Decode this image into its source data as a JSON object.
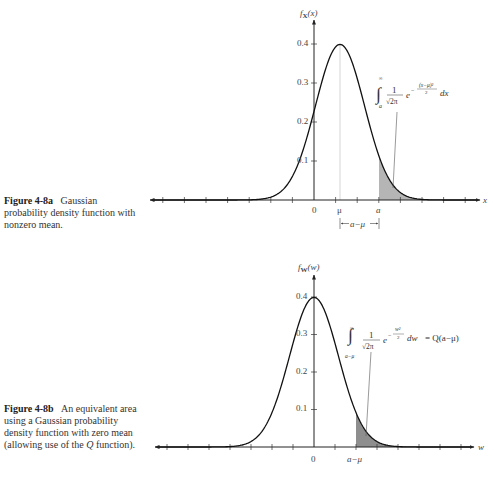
{
  "figures": [
    {
      "id": "4-8a",
      "caption_label": "Figure 4-8a",
      "caption_text": "Gaussian probability density function with nonzero mean.",
      "ylabel": "f_X(x)",
      "ylabel_main": "f",
      "ylabel_sub": "X",
      "ylabel_arg": "(x)",
      "xlabel": "x",
      "ytick_labels": [
        "0.1",
        "0.2",
        "0.3",
        "0.4"
      ],
      "xtick_labels": [
        "0",
        "μ",
        "a"
      ],
      "bracket_label": "a−μ",
      "integral": {
        "lower": "a",
        "upper": "∞",
        "coef_num": "1",
        "coef_den": "√2π",
        "exp": "−(x−μ)²/2",
        "exp_num": "(x−μ)²",
        "exp_den": "2",
        "diff": "dx"
      }
    },
    {
      "id": "4-8b",
      "caption_label": "Figure 4-8b",
      "caption_text": "An equivalent area using a Gaussian probability density function with zero mean (allowing use of the Q function).",
      "caption_pre": "An equivalent area using a Gaussian probability density function with zero mean (allowing use of the ",
      "caption_q": "Q",
      "caption_post": " function).",
      "ylabel": "f_W(w)",
      "ylabel_main": "f",
      "ylabel_sub": "W",
      "ylabel_arg": "(w)",
      "xlabel": "w",
      "ytick_labels": [
        "0.1",
        "0.2",
        "0.3",
        "0.4"
      ],
      "xtick_labels": [
        "0",
        "a−μ"
      ],
      "integral": {
        "lower": "a−μ",
        "upper": "∞",
        "coef_num": "1",
        "coef_den": "√2π",
        "exp_num": "w²",
        "exp_den": "2",
        "diff": "dw",
        "equals": "= Q(a−μ)"
      }
    }
  ],
  "chart_data": [
    {
      "type": "line",
      "title": "Figure 4-8a Gaussian probability density function with nonzero mean",
      "xlabel": "x",
      "ylabel": "f_X(x)",
      "ylim": [
        0,
        0.45
      ],
      "yticks": [
        0.1,
        0.2,
        0.3,
        0.4
      ],
      "grid": false,
      "series": [
        {
          "name": "f_X(x)",
          "distribution": "normal",
          "mean": "μ",
          "std": 1,
          "peak": 0.399
        }
      ],
      "annotations": [
        "shaded area from a to ∞",
        "∫_a^∞ (1/√2π) e^{−(x−μ)²/2} dx",
        "bracket a−μ between μ and a"
      ],
      "px": {
        "origin_x": 314,
        "axis_y": 200,
        "mu_x": 340,
        "a_x": 379,
        "sigma_px": 24.5,
        "y_scale": 390,
        "tick_spacing": 21.6,
        "x_left": 150,
        "x_right": 480
      }
    },
    {
      "type": "line",
      "title": "Figure 4-8b An equivalent area using a Gaussian probability density function with zero mean",
      "xlabel": "w",
      "ylabel": "f_W(w)",
      "ylim": [
        0,
        0.45
      ],
      "yticks": [
        0.1,
        0.2,
        0.3,
        0.4
      ],
      "grid": false,
      "series": [
        {
          "name": "f_W(w)",
          "distribution": "normal",
          "mean": 0,
          "std": 1,
          "peak": 0.399
        }
      ],
      "annotations": [
        "shaded area from a−μ to ∞",
        "∫_{a−μ}^∞ (1/√2π) e^{−w²/2} dw = Q(a−μ)"
      ],
      "px": {
        "origin_x": 314,
        "axis_y": 447,
        "mu_x": 314,
        "a_x": 356,
        "sigma_px": 24.5,
        "y_scale": 375,
        "tick_spacing": 21,
        "x_left": 155,
        "x_right": 474
      }
    }
  ]
}
